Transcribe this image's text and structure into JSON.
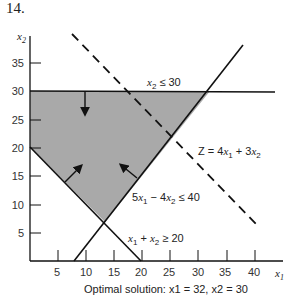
{
  "problem_number": "14.",
  "axes": {
    "x_label": "x1",
    "y_label": "x2",
    "x_ticks": [
      "5",
      "10",
      "15",
      "20",
      "25",
      "30",
      "35",
      "40"
    ],
    "y_ticks": [
      "5",
      "10",
      "15",
      "20",
      "25",
      "30",
      "35"
    ]
  },
  "constraints": [
    {
      "label": "x2 ≤ 30",
      "type": "solid"
    },
    {
      "label": "5x1 − 4x2 ≤ 40",
      "type": "solid"
    },
    {
      "label": "x1 + x2 ≥ 20",
      "type": "solid"
    }
  ],
  "objective": {
    "label": "Z = 4x1 + 3x2",
    "type": "dashed"
  },
  "feasible_region": {
    "vertices": [
      [
        0,
        30
      ],
      [
        32,
        30
      ],
      [
        13.33,
        6.67
      ],
      [
        0,
        20
      ]
    ],
    "fill": "#a9a9a9"
  },
  "caption": "Optimal solution: x1 = 32, x2 = 30",
  "optimal": {
    "x1": 32,
    "x2": 30
  }
}
